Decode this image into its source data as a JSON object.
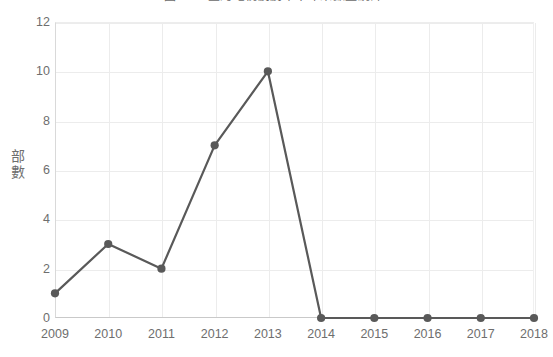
{
  "chart_data": {
    "type": "line",
    "title": "圖3-3　臺灣電視劇劇本十年來數量統計",
    "title_clipped": true,
    "xlabel": "",
    "ylabel": "部數",
    "categories": [
      "2009",
      "2010",
      "2011",
      "2012",
      "2013",
      "2014",
      "2015",
      "2016",
      "2017",
      "2018"
    ],
    "values": [
      1,
      3,
      2,
      7,
      10,
      0,
      0,
      0,
      0,
      0
    ],
    "series": [
      {
        "name": "部數",
        "values": [
          1,
          3,
          2,
          7,
          10,
          0,
          0,
          0,
          0,
          0
        ]
      }
    ],
    "ylim": [
      0,
      12
    ],
    "yticks": [
      0,
      2,
      4,
      6,
      8,
      10,
      12
    ],
    "grid": true,
    "grid_horizontal": true,
    "grid_vertical": true,
    "legend": false,
    "legend_position": "none",
    "marker": "circle",
    "colors": {
      "line": "#595959",
      "marker": "#595959",
      "grid": "#ececec",
      "axis": "#c9c9c9",
      "text": "#6e6e6e",
      "background": "#ffffff"
    }
  }
}
